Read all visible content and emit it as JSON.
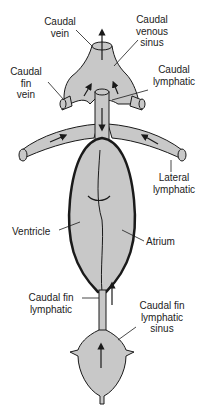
{
  "diagram": {
    "fill_color": "#c8c8c8",
    "stroke_color": "#1a1a1a",
    "labels": {
      "caudal_vein": "Caudal\nvein",
      "caudal_venous_sinus": "Caudal\nvenous\nsinus",
      "caudal_fin_vein": "Caudal\nfin\nvein",
      "caudal_lymphatic": "Caudal\nlymphatic",
      "lateral_lymphatic": "Lateral\nlymphatic",
      "ventricle": "Ventricle",
      "atrium": "Atrium",
      "caudal_fin_lymphatic": "Caudal fin\nlymphatic",
      "caudal_fin_lymphatic_sinus": "Caudal fin\nlymphatic\nsinus"
    }
  }
}
